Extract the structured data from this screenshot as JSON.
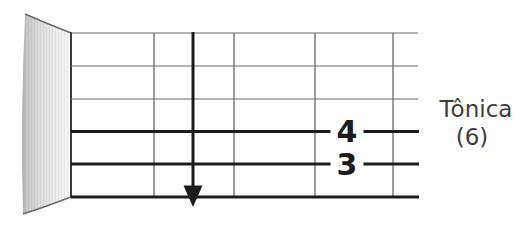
{
  "diagram": {
    "kind": "guitar-fretboard-exercise",
    "annotation": {
      "title": "Tônica",
      "subtitle": "(6)"
    },
    "markers": {
      "string_4": "4",
      "string_5": "3"
    },
    "arrow": {
      "direction": "down",
      "meaning": "downstroke-across-strings"
    },
    "strings": [
      {
        "number": 1,
        "style": "thin",
        "label": ""
      },
      {
        "number": 2,
        "style": "thin",
        "label": ""
      },
      {
        "number": 3,
        "style": "thin",
        "label": ""
      },
      {
        "number": 4,
        "style": "thick",
        "label": "4"
      },
      {
        "number": 5,
        "style": "thick",
        "label": "3"
      },
      {
        "number": 6,
        "style": "thick",
        "label": ""
      }
    ],
    "frets_visible": 4,
    "colors": {
      "background": "#ffffff",
      "thin_line": "#6a6a6a",
      "fret_line": "#5a5a5a",
      "thick_line": "#1c1c1c",
      "edge_line": "#3a3a3a",
      "text": "#3d3d3d",
      "nut_dark": "#a9a9a9",
      "nut_light": "#f8f8f8"
    }
  }
}
